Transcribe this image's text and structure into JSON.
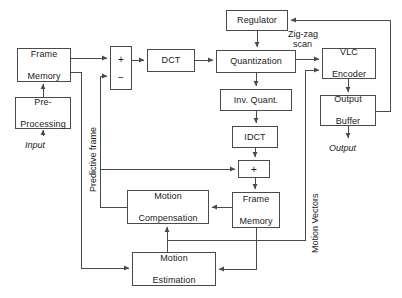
{
  "diagram": {
    "stroke_color": "#4a4a4a",
    "background": "#ffffff",
    "nodes": [
      {
        "id": "frame_memory_in",
        "label": "Frame\nMemory",
        "line1": "Frame",
        "line2": "Memory",
        "x": 17,
        "y": 48,
        "w": 54,
        "h": 34
      },
      {
        "id": "pre_processing",
        "label": "Pre-\nProcessing",
        "line1": "Pre-",
        "line2": "Processing",
        "x": 15,
        "y": 97,
        "w": 56,
        "h": 32
      },
      {
        "id": "dct",
        "label": "DCT",
        "line1": "DCT",
        "line2": "",
        "x": 147,
        "y": 49,
        "w": 48,
        "h": 23
      },
      {
        "id": "regulator",
        "label": "Regulator",
        "line1": "Regulator",
        "line2": "",
        "x": 226,
        "y": 10,
        "w": 62,
        "h": 21
      },
      {
        "id": "quantization",
        "label": "Quantization",
        "line1": "Quantization",
        "line2": "",
        "x": 216,
        "y": 50,
        "w": 80,
        "h": 23
      },
      {
        "id": "inv_quant",
        "label": "Inv. Quant.",
        "line1": "Inv. Quant.",
        "line2": "",
        "x": 220,
        "y": 89,
        "w": 72,
        "h": 22
      },
      {
        "id": "idct",
        "label": "IDCT",
        "line1": "IDCT",
        "line2": "",
        "x": 232,
        "y": 126,
        "w": 46,
        "h": 22
      },
      {
        "id": "vlc_encoder",
        "label": "VLC\nEncoder",
        "line1": "VLC",
        "line2": "Encoder",
        "x": 322,
        "y": 48,
        "w": 54,
        "h": 31
      },
      {
        "id": "output_buffer",
        "label": "Output\nBuffer",
        "line1": "Output",
        "line2": "Buffer",
        "x": 320,
        "y": 95,
        "w": 56,
        "h": 31
      },
      {
        "id": "frame_memory_rec",
        "label": "Frame\nMemory",
        "line1": "Frame",
        "line2": "Memory",
        "x": 232,
        "y": 192,
        "w": 48,
        "h": 36
      },
      {
        "id": "motion_compensation",
        "label": "Motion\nCompensation",
        "line1": "Motion",
        "line2": "Compensation",
        "x": 127,
        "y": 190,
        "w": 82,
        "h": 34
      },
      {
        "id": "motion_estimation",
        "label": "Motion\nEstimation",
        "line1": "Motion",
        "line2": "Estimation",
        "x": 132,
        "y": 252,
        "w": 84,
        "h": 34
      }
    ],
    "operators": [
      {
        "id": "subtractor",
        "x": 110,
        "y": 46,
        "w": 22,
        "h": 44,
        "plus": "+",
        "minus": "−"
      },
      {
        "id": "adder",
        "x": 238,
        "y": 160,
        "w": 32,
        "h": 18,
        "plus": "+",
        "minus": ""
      }
    ],
    "labels": [
      {
        "id": "input_label",
        "text": "Input",
        "x": 25,
        "y": 140,
        "italic": true
      },
      {
        "id": "output_label",
        "text": "Output",
        "x": 329,
        "y": 143,
        "italic": true
      },
      {
        "id": "zigzag_line1",
        "text": "Zig-zag",
        "x": 288,
        "y": 31,
        "italic": false
      },
      {
        "id": "zigzag_line2",
        "text": "scan",
        "x": 293,
        "y": 41,
        "italic": false
      }
    ],
    "vertical_labels": [
      {
        "id": "predictive_frame_label",
        "text": "Predictive frame",
        "x": 88,
        "y": 192
      },
      {
        "id": "motion_vectors_label",
        "text": "Motion Vectors",
        "x": 310,
        "y": 253
      }
    ]
  }
}
